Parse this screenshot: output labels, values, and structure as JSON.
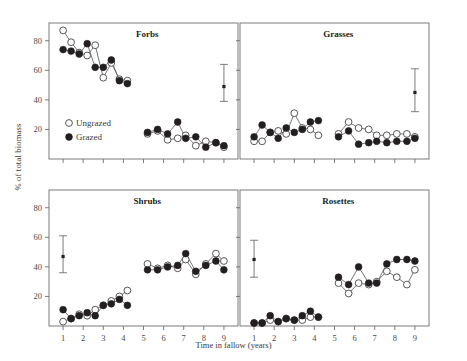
{
  "chart_data": {
    "type": "scatter",
    "title": "",
    "xlabel": "Time in fallow (years)",
    "ylabel": "% of total biomass",
    "xlim": [
      0.3,
      9.7
    ],
    "ylim": [
      0,
      92
    ],
    "xticks": [
      1,
      2,
      3,
      4,
      5,
      6,
      7,
      8,
      9
    ],
    "yticks": [
      20,
      40,
      60,
      80
    ],
    "grid": false,
    "legend_position": "inside-top-left-panel",
    "legend": [
      {
        "name": "Ungrazed",
        "marker": "open-circle"
      },
      {
        "name": "Grazed",
        "marker": "filled-circle"
      }
    ],
    "panels": [
      {
        "name": "Forbs",
        "row": 0,
        "col": 0,
        "error_bar": {
          "x": 9.0,
          "y": 49,
          "lo": 39,
          "hi": 64
        },
        "series": [
          {
            "name": "Ungrazed",
            "points": [
              {
                "x": 1.0,
                "y": 87
              },
              {
                "x": 1.4,
                "y": 79
              },
              {
                "x": 1.8,
                "y": 72
              },
              {
                "x": 2.2,
                "y": 70
              },
              {
                "x": 2.6,
                "y": 77
              },
              {
                "x": 3.0,
                "y": 55
              },
              {
                "x": 3.4,
                "y": 65
              },
              {
                "x": 3.8,
                "y": 54
              },
              {
                "x": 4.2,
                "y": 53
              },
              {
                "x": 5.2,
                "y": 17
              },
              {
                "x": 5.7,
                "y": 19
              },
              {
                "x": 6.2,
                "y": 13
              },
              {
                "x": 6.7,
                "y": 14
              },
              {
                "x": 7.1,
                "y": 16
              },
              {
                "x": 7.6,
                "y": 9
              },
              {
                "x": 8.1,
                "y": 12
              },
              {
                "x": 8.6,
                "y": 11
              },
              {
                "x": 9.0,
                "y": 8
              }
            ]
          },
          {
            "name": "Grazed",
            "points": [
              {
                "x": 1.0,
                "y": 74
              },
              {
                "x": 1.4,
                "y": 73
              },
              {
                "x": 1.8,
                "y": 71
              },
              {
                "x": 2.2,
                "y": 78
              },
              {
                "x": 2.6,
                "y": 62
              },
              {
                "x": 3.0,
                "y": 62
              },
              {
                "x": 3.4,
                "y": 67
              },
              {
                "x": 3.8,
                "y": 53
              },
              {
                "x": 4.2,
                "y": 51
              },
              {
                "x": 5.2,
                "y": 18
              },
              {
                "x": 5.7,
                "y": 20
              },
              {
                "x": 6.2,
                "y": 17
              },
              {
                "x": 6.7,
                "y": 25
              },
              {
                "x": 7.1,
                "y": 14
              },
              {
                "x": 7.6,
                "y": 15
              },
              {
                "x": 8.1,
                "y": 8
              },
              {
                "x": 8.6,
                "y": 11
              },
              {
                "x": 9.0,
                "y": 9
              }
            ]
          }
        ]
      },
      {
        "name": "Grasses",
        "row": 0,
        "col": 1,
        "error_bar": {
          "x": 9.0,
          "y": 45,
          "lo": 32,
          "hi": 61
        },
        "series": [
          {
            "name": "Ungrazed",
            "points": [
              {
                "x": 1.0,
                "y": 12
              },
              {
                "x": 1.4,
                "y": 12
              },
              {
                "x": 1.8,
                "y": 18
              },
              {
                "x": 2.2,
                "y": 19
              },
              {
                "x": 2.6,
                "y": 17
              },
              {
                "x": 3.0,
                "y": 31
              },
              {
                "x": 3.4,
                "y": 21
              },
              {
                "x": 3.8,
                "y": 20
              },
              {
                "x": 4.2,
                "y": 16
              },
              {
                "x": 5.2,
                "y": 17
              },
              {
                "x": 5.7,
                "y": 25
              },
              {
                "x": 6.2,
                "y": 21
              },
              {
                "x": 6.7,
                "y": 20
              },
              {
                "x": 7.1,
                "y": 16
              },
              {
                "x": 7.6,
                "y": 16
              },
              {
                "x": 8.1,
                "y": 17
              },
              {
                "x": 8.6,
                "y": 17
              },
              {
                "x": 9.0,
                "y": 15
              }
            ]
          },
          {
            "name": "Grazed",
            "points": [
              {
                "x": 1.0,
                "y": 15
              },
              {
                "x": 1.4,
                "y": 23
              },
              {
                "x": 1.8,
                "y": 18
              },
              {
                "x": 2.2,
                "y": 14
              },
              {
                "x": 2.6,
                "y": 21
              },
              {
                "x": 3.0,
                "y": 18
              },
              {
                "x": 3.4,
                "y": 20
              },
              {
                "x": 3.8,
                "y": 25
              },
              {
                "x": 4.2,
                "y": 26
              },
              {
                "x": 5.2,
                "y": 15
              },
              {
                "x": 5.7,
                "y": 19
              },
              {
                "x": 6.2,
                "y": 10
              },
              {
                "x": 6.7,
                "y": 11
              },
              {
                "x": 7.1,
                "y": 12
              },
              {
                "x": 7.6,
                "y": 11
              },
              {
                "x": 8.1,
                "y": 12
              },
              {
                "x": 8.6,
                "y": 12
              },
              {
                "x": 9.0,
                "y": 14
              }
            ]
          }
        ]
      },
      {
        "name": "Shrubs",
        "row": 1,
        "col": 0,
        "error_bar": {
          "x": 1.0,
          "y": 47,
          "lo": 36,
          "hi": 61
        },
        "series": [
          {
            "name": "Ungrazed",
            "points": [
              {
                "x": 1.0,
                "y": 3
              },
              {
                "x": 1.4,
                "y": 5
              },
              {
                "x": 1.8,
                "y": 8
              },
              {
                "x": 2.2,
                "y": 7
              },
              {
                "x": 2.6,
                "y": 11
              },
              {
                "x": 3.0,
                "y": 14
              },
              {
                "x": 3.4,
                "y": 17
              },
              {
                "x": 3.8,
                "y": 20
              },
              {
                "x": 4.2,
                "y": 24
              },
              {
                "x": 5.2,
                "y": 42
              },
              {
                "x": 5.7,
                "y": 39
              },
              {
                "x": 6.2,
                "y": 41
              },
              {
                "x": 6.7,
                "y": 39
              },
              {
                "x": 7.1,
                "y": 45
              },
              {
                "x": 7.6,
                "y": 35
              },
              {
                "x": 8.1,
                "y": 42
              },
              {
                "x": 8.6,
                "y": 49
              },
              {
                "x": 9.0,
                "y": 44
              }
            ]
          },
          {
            "name": "Grazed",
            "points": [
              {
                "x": 1.0,
                "y": 11
              },
              {
                "x": 1.4,
                "y": 5
              },
              {
                "x": 1.8,
                "y": 7
              },
              {
                "x": 2.2,
                "y": 9
              },
              {
                "x": 2.6,
                "y": 7
              },
              {
                "x": 3.0,
                "y": 14
              },
              {
                "x": 3.4,
                "y": 15
              },
              {
                "x": 3.8,
                "y": 18
              },
              {
                "x": 4.2,
                "y": 14
              },
              {
                "x": 5.2,
                "y": 38
              },
              {
                "x": 5.7,
                "y": 38
              },
              {
                "x": 6.2,
                "y": 40
              },
              {
                "x": 6.7,
                "y": 41
              },
              {
                "x": 7.1,
                "y": 49
              },
              {
                "x": 7.6,
                "y": 37
              },
              {
                "x": 8.1,
                "y": 41
              },
              {
                "x": 8.6,
                "y": 44
              },
              {
                "x": 9.0,
                "y": 38
              }
            ]
          }
        ]
      },
      {
        "name": "Rosettes",
        "row": 1,
        "col": 1,
        "error_bar": {
          "x": 1.0,
          "y": 45,
          "lo": 33,
          "hi": 58
        },
        "series": [
          {
            "name": "Ungrazed",
            "points": [
              {
                "x": 1.0,
                "y": 2
              },
              {
                "x": 1.4,
                "y": 2
              },
              {
                "x": 1.8,
                "y": 4
              },
              {
                "x": 2.2,
                "y": 3
              },
              {
                "x": 2.6,
                "y": 5
              },
              {
                "x": 3.0,
                "y": 4
              },
              {
                "x": 3.4,
                "y": 4
              },
              {
                "x": 3.8,
                "y": 6
              },
              {
                "x": 4.2,
                "y": 6
              },
              {
                "x": 5.2,
                "y": 29
              },
              {
                "x": 5.7,
                "y": 22
              },
              {
                "x": 6.2,
                "y": 29
              },
              {
                "x": 6.7,
                "y": 28
              },
              {
                "x": 7.1,
                "y": 30
              },
              {
                "x": 7.6,
                "y": 37
              },
              {
                "x": 8.1,
                "y": 33
              },
              {
                "x": 8.6,
                "y": 28
              },
              {
                "x": 9.0,
                "y": 38
              }
            ]
          },
          {
            "name": "Grazed",
            "points": [
              {
                "x": 1.0,
                "y": 2
              },
              {
                "x": 1.4,
                "y": 2
              },
              {
                "x": 1.8,
                "y": 7
              },
              {
                "x": 2.2,
                "y": 3
              },
              {
                "x": 2.6,
                "y": 5
              },
              {
                "x": 3.0,
                "y": 4
              },
              {
                "x": 3.4,
                "y": 7
              },
              {
                "x": 3.8,
                "y": 10
              },
              {
                "x": 4.2,
                "y": 6
              },
              {
                "x": 5.2,
                "y": 33
              },
              {
                "x": 5.7,
                "y": 28
              },
              {
                "x": 6.2,
                "y": 40
              },
              {
                "x": 6.7,
                "y": 29
              },
              {
                "x": 7.1,
                "y": 29
              },
              {
                "x": 7.6,
                "y": 42
              },
              {
                "x": 8.1,
                "y": 45
              },
              {
                "x": 8.6,
                "y": 45
              },
              {
                "x": 9.0,
                "y": 44
              }
            ]
          }
        ]
      }
    ]
  }
}
